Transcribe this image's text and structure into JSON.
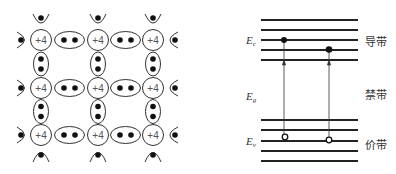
{
  "lattice": {
    "atom_label": "+4",
    "atoms": [
      {
        "x": 41,
        "y": 40
      },
      {
        "x": 98,
        "y": 40
      },
      {
        "x": 153,
        "y": 40
      },
      {
        "x": 41,
        "y": 88
      },
      {
        "x": 98,
        "y": 88
      },
      {
        "x": 153,
        "y": 88
      },
      {
        "x": 41,
        "y": 135
      },
      {
        "x": 98,
        "y": 135
      },
      {
        "x": 153,
        "y": 135
      }
    ]
  },
  "band_diagram": {
    "conduction_band_label": "导带",
    "forbidden_band_label": "禁带",
    "valence_band_label": "价带",
    "ec_label": "E",
    "ec_sub": "c",
    "eg_label": "E",
    "eg_sub": "g",
    "ev_label": "E",
    "ev_sub": "v",
    "conduction_lines_y": [
      20,
      30,
      40,
      50,
      60
    ],
    "valence_lines_y": [
      120,
      130,
      141,
      151,
      161
    ],
    "line_x_start": 261,
    "line_x_end": 358,
    "transitions": [
      {
        "x": 284,
        "electron_y": 40,
        "hole_y": 137
      },
      {
        "x": 329,
        "electron_y": 50,
        "hole_y": 140
      }
    ]
  }
}
